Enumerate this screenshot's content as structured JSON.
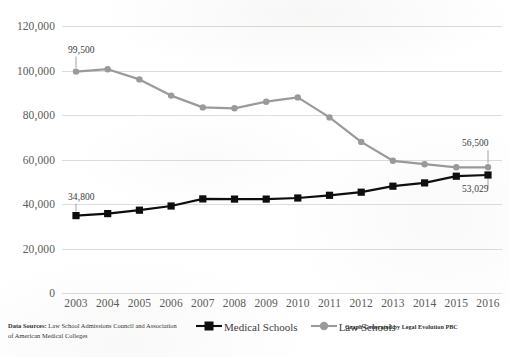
{
  "chart_data": {
    "type": "line",
    "title": "",
    "subtitle": "",
    "xlabel": "",
    "ylabel": "",
    "x": [
      2003,
      2004,
      2005,
      2006,
      2007,
      2008,
      2009,
      2010,
      2011,
      2012,
      2013,
      2014,
      2015,
      2016
    ],
    "categories": [
      "2003",
      "2004",
      "2005",
      "2006",
      "2007",
      "2008",
      "2009",
      "2010",
      "2011",
      "2012",
      "2013",
      "2014",
      "2015",
      "2016"
    ],
    "ylim": [
      0,
      120000
    ],
    "ytick_values": [
      0,
      20000,
      40000,
      60000,
      80000,
      100000,
      120000
    ],
    "ytick_labels": [
      "0",
      "20,000",
      "40,000",
      "60,000",
      "80,000",
      "100,000",
      "120,000"
    ],
    "grid": true,
    "legend_position": "bottom",
    "series": [
      {
        "name": "Medical Schools",
        "color": "#0d0d0d",
        "marker": "square",
        "values": [
          34800,
          35700,
          37200,
          39100,
          42300,
          42200,
          42200,
          42700,
          43900,
          45300,
          48000,
          49500,
          52500,
          53029
        ]
      },
      {
        "name": "Law Schools",
        "color": "#9a9a9a",
        "marker": "circle",
        "values": [
          99500,
          100600,
          96000,
          88700,
          83400,
          83000,
          86000,
          87900,
          78900,
          67900,
          59400,
          57900,
          56500,
          56500
        ]
      }
    ],
    "annotations": [
      {
        "text": "99,500",
        "series": "Law Schools",
        "x": 2003,
        "value": 99500
      },
      {
        "text": "34,800",
        "series": "Medical Schools",
        "x": 2003,
        "value": 34800
      },
      {
        "text": "56,500",
        "series": "Law Schools",
        "x": 2016,
        "value": 56500
      },
      {
        "text": "53,029",
        "series": "Medical Schools",
        "x": 2016,
        "value": 53029
      }
    ]
  },
  "footer": {
    "sources_label": "Data Sources:",
    "sources_text": " Law School Admissions Council and Association of American Medical Colleges",
    "credit": "Graph Generated by Legal Evolution PBC"
  }
}
